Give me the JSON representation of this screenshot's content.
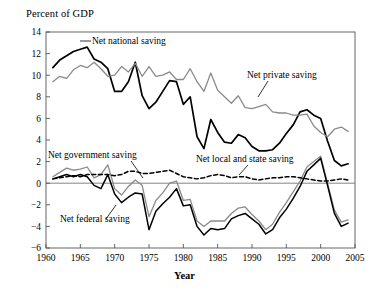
{
  "chart_data": {
    "type": "line",
    "title": "",
    "ylabel": "Percent of  GDP",
    "xlabel": "Year",
    "xlim": [
      1960,
      2005
    ],
    "ylim": [
      -6,
      14
    ],
    "yticks": [
      -6,
      -4,
      -2,
      0,
      2,
      4,
      6,
      8,
      10,
      12,
      14
    ],
    "ytick_labels": [
      "−6",
      "−4",
      "−2",
      "0",
      "2",
      "4",
      "6",
      "8",
      "10",
      "12",
      "14"
    ],
    "xticks": [
      1960,
      1965,
      1970,
      1975,
      1980,
      1985,
      1990,
      1995,
      2000,
      2005
    ],
    "xtick_labels": [
      "1960",
      "1965",
      "1970",
      "1975",
      "1980",
      "1985",
      "1990",
      "1995",
      "2000",
      "2005"
    ],
    "grid": false,
    "legend_position": "inline-annotations",
    "x": [
      1961,
      1962,
      1963,
      1964,
      1965,
      1966,
      1967,
      1968,
      1969,
      1970,
      1971,
      1972,
      1973,
      1974,
      1975,
      1976,
      1977,
      1978,
      1979,
      1980,
      1981,
      1982,
      1983,
      1984,
      1985,
      1986,
      1987,
      1988,
      1989,
      1990,
      1991,
      1992,
      1993,
      1994,
      1995,
      1996,
      1997,
      1998,
      1999,
      2000,
      2001,
      2002,
      2003,
      2004
    ],
    "series": [
      {
        "name": "Net national saving",
        "color": "#000000",
        "style": "solid",
        "width": 1.7,
        "values": [
          10.7,
          11.4,
          11.8,
          12.2,
          12.4,
          12.6,
          11.5,
          11.2,
          10.6,
          8.5,
          8.5,
          9.4,
          11.2,
          8.1,
          6.9,
          7.5,
          8.5,
          9.5,
          9.4,
          7.3,
          8.0,
          4.3,
          3.2,
          5.9,
          4.7,
          3.8,
          3.7,
          4.5,
          4.2,
          3.4,
          3.0,
          3.0,
          3.1,
          3.7,
          4.6,
          5.4,
          6.6,
          6.8,
          6.3,
          6.0,
          3.9,
          2.1,
          1.6,
          1.8
        ]
      },
      {
        "name": "Net private saving",
        "color": "#8a8a8a",
        "style": "solid",
        "width": 1.3,
        "values": [
          9.4,
          9.9,
          9.7,
          10.5,
          10.9,
          10.7,
          11.2,
          10.6,
          9.9,
          10.0,
          10.8,
          10.3,
          11.1,
          9.9,
          10.8,
          9.9,
          10.0,
          10.3,
          9.6,
          9.6,
          10.6,
          9.4,
          8.5,
          10.2,
          8.6,
          8.0,
          7.4,
          8.1,
          7.0,
          6.9,
          7.1,
          7.3,
          6.6,
          6.5,
          6.5,
          6.3,
          6.3,
          6.4,
          5.3,
          4.7,
          4.3,
          5.0,
          5.2,
          4.8
        ]
      },
      {
        "name": "Net government saving",
        "color": "#8a8a8a",
        "style": "solid",
        "width": 1.3,
        "values": [
          0.6,
          1.0,
          1.4,
          1.2,
          1.3,
          1.5,
          0.5,
          0.8,
          1.7,
          -0.5,
          -1.1,
          -0.3,
          0.3,
          -0.2,
          -3.1,
          -1.6,
          -0.9,
          0.0,
          0.2,
          -1.6,
          -1.5,
          -3.5,
          -4.0,
          -3.5,
          -3.5,
          -3.5,
          -2.8,
          -2.3,
          -2.2,
          -2.9,
          -3.5,
          -4.3,
          -3.8,
          -2.7,
          -1.8,
          -0.8,
          0.2,
          1.5,
          2.0,
          2.5,
          0.0,
          -2.5,
          -3.6,
          -3.4
        ]
      },
      {
        "name": "Net federal saving",
        "color": "#000000",
        "style": "solid",
        "width": 1.5,
        "values": [
          0.4,
          0.6,
          0.8,
          0.6,
          0.8,
          0.6,
          -0.2,
          -0.5,
          0.8,
          -1.0,
          -1.8,
          -1.3,
          -0.9,
          -1.0,
          -4.3,
          -2.6,
          -1.9,
          -1.3,
          -0.5,
          -2.1,
          -2.0,
          -4.0,
          -4.8,
          -4.2,
          -4.3,
          -4.2,
          -3.3,
          -3.0,
          -2.8,
          -3.3,
          -3.8,
          -4.7,
          -4.3,
          -3.2,
          -2.4,
          -1.4,
          -0.3,
          1.1,
          1.7,
          2.3,
          -0.2,
          -2.8,
          -4.0,
          -3.7
        ]
      },
      {
        "name": "Net local and state saving",
        "color": "#000000",
        "style": "dashed",
        "width": 1.5,
        "values": [
          0.4,
          0.5,
          0.6,
          0.7,
          0.6,
          0.8,
          0.8,
          0.8,
          0.8,
          0.7,
          0.8,
          1.1,
          1.1,
          0.9,
          0.9,
          1.0,
          1.1,
          1.2,
          0.9,
          0.6,
          0.5,
          0.4,
          0.5,
          0.7,
          0.8,
          0.7,
          0.5,
          0.6,
          0.6,
          0.4,
          0.3,
          0.4,
          0.5,
          0.5,
          0.6,
          0.6,
          0.5,
          0.4,
          0.3,
          0.2,
          0.2,
          0.3,
          0.4,
          0.3
        ]
      }
    ],
    "annotations": [
      {
        "name": "net-national-saving-label",
        "text": "Net national saving",
        "x": 92,
        "y": 44
      },
      {
        "name": "net-private-saving-label",
        "text": "Net private saving",
        "x": 247,
        "y": 78
      },
      {
        "name": "net-government-saving-label",
        "text": "Net government saving",
        "x": 48,
        "y": 158
      },
      {
        "name": "net-local-and-state-saving-label",
        "text": "Net local and state saving",
        "x": 196,
        "y": 162
      },
      {
        "name": "net-federal-saving-label",
        "text": "Net federal saving",
        "x": 60,
        "y": 222
      }
    ]
  }
}
